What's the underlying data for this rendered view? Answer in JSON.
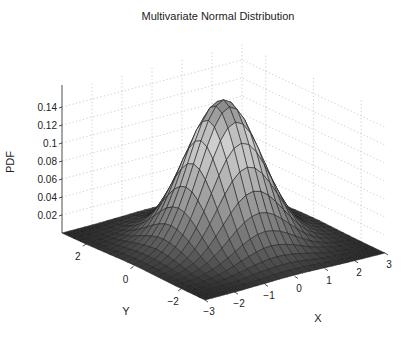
{
  "chart_data": {
    "type": "surface",
    "title": "Multivariate Normal Distribution",
    "xlabel": "X",
    "ylabel": "Y",
    "zlabel": "PDF",
    "x_ticks": [
      "−3",
      "−2",
      "−1",
      "0",
      "1",
      "2",
      "3"
    ],
    "y_ticks": [
      "−2",
      "0",
      "2"
    ],
    "z_ticks": [
      "0.02",
      "0.04",
      "0.06",
      "0.08",
      "0.1",
      "0.12",
      "0.14"
    ],
    "xlim": [
      -3,
      3
    ],
    "ylim": [
      -3,
      3
    ],
    "zlim": [
      0,
      0.16
    ],
    "grid": true,
    "colormap": "gray",
    "function": "bivariate normal, mu=[0,0], Sigma=[[1,0],[0,1]]",
    "peak_value": 0.159,
    "grid_resolution": 25
  }
}
